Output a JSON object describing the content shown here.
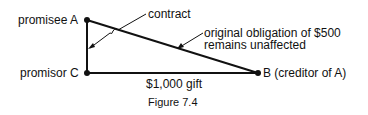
{
  "diagram": {
    "nodes": {
      "a": {
        "label": "promisee A"
      },
      "c": {
        "label": "promisor C"
      },
      "b": {
        "label": "B (creditor of A)"
      }
    },
    "edges": {
      "ac": {
        "label": "contract"
      },
      "ab": {
        "label_line1": "original obligation of $500",
        "label_line2": "remains unaffected"
      },
      "cb": {
        "label": "$1,000 gift"
      }
    },
    "caption": "Figure 7.4"
  }
}
